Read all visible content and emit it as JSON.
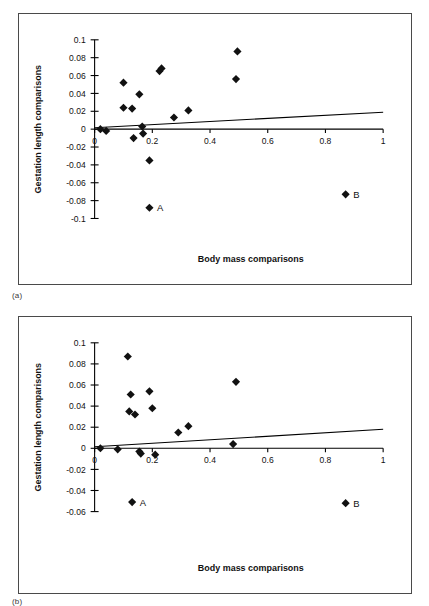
{
  "figure": {
    "captions": {
      "panel_a": "(a)",
      "panel_b": "(b)"
    }
  },
  "chart_data": [
    {
      "id": "panel-a",
      "type": "scatter",
      "title": "",
      "xlabel": "Body mass comparisons",
      "ylabel": "Gestation length comparisons",
      "xlim": [
        0,
        1
      ],
      "ylim": [
        -0.1,
        0.1
      ],
      "xticks": [
        0,
        0.2,
        0.4,
        0.6,
        0.8,
        1
      ],
      "xticklabels": [
        "0",
        "0.2",
        "0.4",
        "0.6",
        "0.8",
        "1"
      ],
      "yticks": [
        -0.1,
        -0.08,
        -0.06,
        -0.04,
        -0.02,
        0,
        0.02,
        0.04,
        0.06,
        0.08,
        0.1
      ],
      "yticklabels": [
        "-0.1",
        "-0.08",
        "-0.06",
        "-0.04",
        "-0.02",
        "0",
        "0.02",
        "0.04",
        "0.06",
        "0.08",
        "0.1"
      ],
      "grid": false,
      "legend": null,
      "points": [
        {
          "x": 0.02,
          "y": 0.0
        },
        {
          "x": 0.04,
          "y": -0.002
        },
        {
          "x": 0.1,
          "y": 0.024
        },
        {
          "x": 0.1,
          "y": 0.052
        },
        {
          "x": 0.13,
          "y": 0.023
        },
        {
          "x": 0.135,
          "y": -0.01
        },
        {
          "x": 0.155,
          "y": 0.039
        },
        {
          "x": 0.165,
          "y": 0.003
        },
        {
          "x": 0.168,
          "y": -0.005
        },
        {
          "x": 0.19,
          "y": -0.035
        },
        {
          "x": 0.225,
          "y": 0.065
        },
        {
          "x": 0.232,
          "y": 0.068
        },
        {
          "x": 0.275,
          "y": 0.013
        },
        {
          "x": 0.325,
          "y": 0.021
        },
        {
          "x": 0.49,
          "y": 0.056
        },
        {
          "x": 0.495,
          "y": 0.087
        },
        {
          "x": 0.19,
          "y": -0.088,
          "label": "A"
        },
        {
          "x": 0.87,
          "y": -0.073,
          "label": "B"
        }
      ],
      "trendline": {
        "x": [
          0.0,
          1.0
        ],
        "y": [
          0.0015,
          0.019
        ]
      }
    },
    {
      "id": "panel-b",
      "type": "scatter",
      "title": "",
      "xlabel": "Body mass comparisons",
      "ylabel": "Gestation length comparisons",
      "xlim": [
        0,
        1
      ],
      "ylim": [
        -0.06,
        0.1
      ],
      "xticks": [
        0,
        0.2,
        0.4,
        0.6,
        0.8,
        1
      ],
      "xticklabels": [
        "0",
        "0.2",
        "0.4",
        "0.6",
        "0.8",
        "1"
      ],
      "yticks": [
        -0.06,
        -0.04,
        -0.02,
        0,
        0.02,
        0.04,
        0.06,
        0.08,
        0.1
      ],
      "yticklabels": [
        "-0.06",
        "-0.04",
        "-0.02",
        "0",
        "0.02",
        "0.04",
        "0.06",
        "0.08",
        "0.1"
      ],
      "grid": false,
      "legend": null,
      "points": [
        {
          "x": 0.02,
          "y": 0.0
        },
        {
          "x": 0.08,
          "y": -0.001
        },
        {
          "x": 0.115,
          "y": 0.087
        },
        {
          "x": 0.12,
          "y": 0.035
        },
        {
          "x": 0.125,
          "y": 0.051
        },
        {
          "x": 0.14,
          "y": 0.032
        },
        {
          "x": 0.155,
          "y": -0.003
        },
        {
          "x": 0.16,
          "y": -0.005
        },
        {
          "x": 0.19,
          "y": 0.054
        },
        {
          "x": 0.2,
          "y": 0.038
        },
        {
          "x": 0.21,
          "y": -0.006
        },
        {
          "x": 0.29,
          "y": 0.015
        },
        {
          "x": 0.325,
          "y": 0.021
        },
        {
          "x": 0.48,
          "y": 0.004
        },
        {
          "x": 0.49,
          "y": 0.063
        },
        {
          "x": 0.13,
          "y": -0.051,
          "label": "A"
        },
        {
          "x": 0.87,
          "y": -0.052,
          "label": "B"
        }
      ],
      "trendline": {
        "x": [
          0.0,
          1.0
        ],
        "y": [
          0.0015,
          0.018
        ]
      }
    }
  ]
}
